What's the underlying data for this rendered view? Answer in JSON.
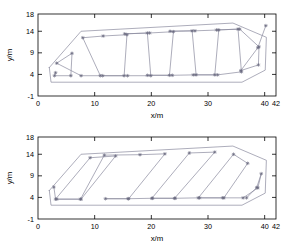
{
  "figure": {
    "background_color": "#ffffff",
    "axis_color": "#000000",
    "series_color": "#8a8a9e",
    "marker_color": "#6a6a80"
  },
  "chart_data": [
    {
      "type": "line",
      "title": "",
      "subtitle": "",
      "xlabel": "x/m",
      "ylabel": "y/m",
      "xlim": [
        0,
        42
      ],
      "ylim": [
        -1,
        18
      ],
      "xticks": [
        0,
        10,
        20,
        30,
        40,
        42
      ],
      "xticklabels": [
        "0",
        "10",
        "20",
        "30",
        "40",
        "42"
      ],
      "yticks": [
        -1,
        4,
        9,
        14,
        18
      ],
      "yticklabels": [
        "-1",
        "4",
        "9",
        "14",
        "18"
      ],
      "grid": false,
      "legend": null,
      "annotations": [],
      "series": [
        {
          "name": "field-boundary",
          "style": "line",
          "marker": "none",
          "closed": true,
          "x": [
            2.0,
            7.6,
            34.4,
            40.3,
            40.1,
            36.0,
            2.3,
            2.0
          ],
          "y": [
            5.6,
            14.0,
            15.9,
            12.6,
            5.0,
            2.2,
            2.2,
            5.6
          ]
        },
        {
          "name": "coverage-path",
          "style": "line",
          "marker": "asterisk",
          "closed": false,
          "x": [
            3.1,
            2.9,
            5.8,
            6.0,
            3.3,
            7.6,
            11.0,
            7.9,
            11.5,
            15.7,
            15.2,
            11.4,
            15.8,
            19.9,
            19.3,
            15.3,
            19.7,
            23.9,
            23.2,
            19.3,
            23.7,
            27.9,
            27.2,
            23.3,
            27.7,
            31.9,
            31.2,
            27.4,
            31.7,
            35.9,
            35.3,
            31.5,
            35.6,
            39.0,
            38.9,
            35.8,
            38.8,
            40.2
          ],
          "y": [
            4.4,
            3.7,
            3.7,
            8.9,
            6.6,
            3.7,
            3.7,
            12.5,
            12.9,
            13.2,
            3.7,
            3.7,
            3.7,
            3.7,
            13.6,
            13.4,
            13.6,
            13.9,
            3.8,
            3.8,
            3.8,
            3.9,
            14.1,
            14.0,
            14.1,
            14.3,
            3.9,
            3.9,
            3.9,
            4.6,
            14.5,
            14.3,
            14.5,
            10.4,
            6.2,
            4.9,
            10.2,
            15.3
          ]
        }
      ]
    },
    {
      "type": "line",
      "title": "",
      "subtitle": "",
      "xlabel": "x/m",
      "ylabel": "y/m",
      "xlim": [
        0,
        42
      ],
      "ylim": [
        -1,
        18
      ],
      "xticks": [
        0,
        10,
        20,
        30,
        40,
        42
      ],
      "xticklabels": [
        "0",
        "10",
        "20",
        "30",
        "40",
        "42"
      ],
      "yticks": [
        -1,
        4,
        9,
        14,
        18
      ],
      "yticklabels": [
        "-1",
        "4",
        "9",
        "14",
        "18"
      ],
      "grid": false,
      "legend": null,
      "annotations": [],
      "series": [
        {
          "name": "field-boundary",
          "style": "line",
          "marker": "none",
          "closed": true,
          "x": [
            2.0,
            7.6,
            34.4,
            40.3,
            40.1,
            36.0,
            2.3,
            2.0
          ],
          "y": [
            5.6,
            14.0,
            15.9,
            12.6,
            5.0,
            2.2,
            2.2,
            5.6
          ]
        },
        {
          "name": "coverage-path",
          "style": "line",
          "marker": "asterisk",
          "closed": false,
          "x": [
            2.8,
            3.1,
            9.2,
            13.7,
            7.6,
            3.3,
            7.5,
            11.7,
            18.0,
            22.4,
            16.0,
            11.9,
            15.9,
            20.1,
            26.7,
            31.2,
            24.1,
            20.2,
            24.2,
            28.3,
            34.5,
            37.0,
            32.8,
            28.5,
            32.6,
            36.2,
            38.8,
            39.4,
            38.6,
            36.8
          ],
          "y": [
            6.4,
            3.6,
            13.2,
            13.6,
            3.6,
            3.6,
            3.6,
            13.8,
            13.9,
            14.1,
            3.7,
            3.7,
            3.7,
            3.8,
            14.3,
            14.5,
            3.8,
            3.8,
            3.8,
            3.9,
            14.0,
            11.9,
            3.9,
            3.9,
            3.9,
            3.9,
            6.2,
            9.5,
            6.3,
            3.9
          ]
        }
      ]
    }
  ]
}
